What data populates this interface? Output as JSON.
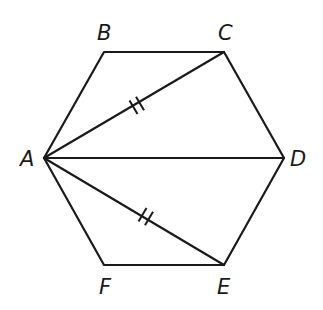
{
  "diagram": {
    "type": "regular hexagon with diagonals",
    "vertices": {
      "A": {
        "label": "A",
        "x": 44,
        "y": 158
      },
      "B": {
        "label": "B",
        "x": 104,
        "y": 52
      },
      "C": {
        "label": "C",
        "x": 224,
        "y": 52
      },
      "D": {
        "label": "D",
        "x": 284,
        "y": 158
      },
      "E": {
        "label": "E",
        "x": 224,
        "y": 265
      },
      "F": {
        "label": "F",
        "x": 104,
        "y": 265
      }
    },
    "edges": [
      "AB",
      "BC",
      "CD",
      "DE",
      "EF",
      "FA"
    ],
    "diagonals": [
      "AC",
      "AD",
      "AE"
    ],
    "congruence_marks": [
      {
        "segment": "AC",
        "ticks": 2
      },
      {
        "segment": "AE",
        "ticks": 2
      }
    ],
    "colors": {
      "stroke": "#1a1a1a",
      "background": "#ffffff"
    }
  }
}
